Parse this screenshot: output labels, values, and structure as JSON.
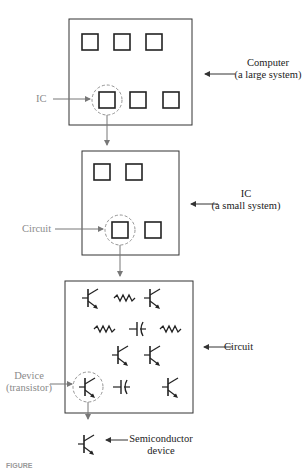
{
  "figure": {
    "levels": [
      {
        "name": "computer",
        "label_line1": "Computer",
        "label_line2": "(a large system)",
        "highlight_label": "IC"
      },
      {
        "name": "ic",
        "label_line1": "IC",
        "label_line2": "(a small system)",
        "highlight_label": "Circuit"
      },
      {
        "name": "circuit",
        "label_line1": "Circuit",
        "highlight_label_line1": "Device",
        "highlight_label_line2": "(transistor)"
      },
      {
        "name": "device",
        "label_line1": "Semiconductor",
        "label_line2": "device"
      }
    ],
    "caption": "FIGURE"
  },
  "colors": {
    "line": "#333333",
    "arrow": "#777777",
    "gray_text": "#8a8a8a",
    "dark_text": "#222222"
  }
}
